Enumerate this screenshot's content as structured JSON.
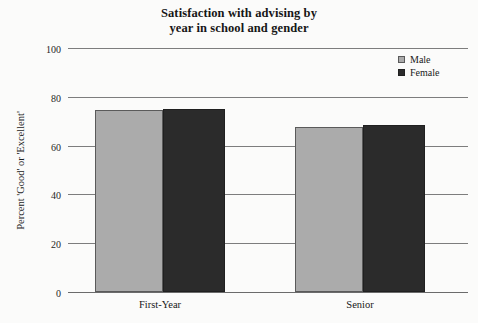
{
  "chart_data": {
    "type": "bar",
    "title": "Satisfaction with advising by year in school and gender",
    "title_lines": [
      "Satisfaction with advising by",
      "year in school and gender"
    ],
    "xlabel": "",
    "ylabel": "Percent 'Good' or 'Excellent'",
    "categories": [
      "First-Year",
      "Senior"
    ],
    "series": [
      {
        "name": "Male",
        "values": [
          74.5,
          67.5
        ],
        "color": "#ababab"
      },
      {
        "name": "Female",
        "values": [
          75.0,
          68.5
        ],
        "color": "#2b2b2b"
      }
    ],
    "ylim": [
      0,
      100
    ],
    "yticks": [
      0,
      20,
      40,
      60,
      80,
      100
    ],
    "ytick_labels": [
      "0",
      "20",
      "40",
      "60",
      "80",
      "100"
    ],
    "grid": true,
    "legend_position": "top-right"
  },
  "legend": {
    "entries": [
      {
        "label": "Male",
        "swatch": "male"
      },
      {
        "label": "Female",
        "swatch": "female"
      }
    ]
  }
}
